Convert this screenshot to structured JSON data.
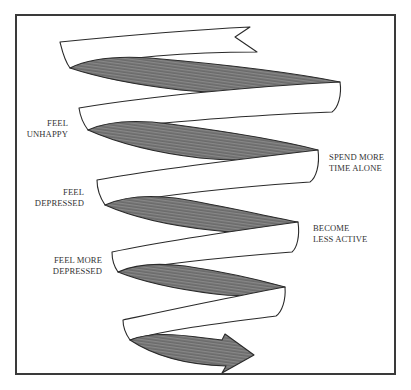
{
  "diagram": {
    "type": "downward spiral ribbon",
    "colors": {
      "frame": "#3a3a3a",
      "ribbon_outline": "#2a2a2a",
      "ribbon_light": "#ffffff",
      "ribbon_shade": "#7a7a7a",
      "text": "#333333"
    },
    "labels": {
      "feel_unhappy": {
        "line1": "FEEL",
        "line2": "UNHAPPY"
      },
      "spend_more_time_alone": {
        "line1": "SPEND MORE",
        "line2": "TIME ALONE"
      },
      "feel_depressed": {
        "line1": "FEEL",
        "line2": "DEPRESSED"
      },
      "become_less_active": {
        "line1": "BECOME",
        "line2": "LESS ACTIVE"
      },
      "feel_more_depressed": {
        "line1": "FEEL MORE",
        "line2": "DEPRESSED"
      }
    },
    "arrow_icon": "arrow-right-icon"
  }
}
